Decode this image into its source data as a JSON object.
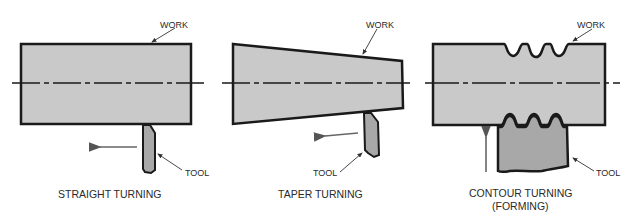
{
  "diagram": {
    "colors": {
      "work_fill": "#c9c9c9",
      "tool_fill": "#a8a8a8",
      "outline": "#1a1a1a",
      "arrow": "#6e6e6e"
    },
    "panels": [
      {
        "caption": "STRAIGHT TURNING",
        "caption2": "",
        "work_label": "WORK",
        "tool_label": "TOOL"
      },
      {
        "caption": "TAPER TURNING",
        "caption2": "",
        "work_label": "WORK",
        "tool_label": "TOOL"
      },
      {
        "caption": "CONTOUR TURNING",
        "caption2": "(FORMING)",
        "work_label": "WORK",
        "tool_label": "TOOL"
      }
    ]
  }
}
